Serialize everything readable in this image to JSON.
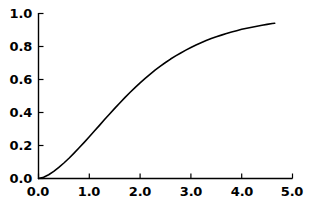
{
  "chart_data": {
    "type": "line",
    "title": "",
    "subtitle": "",
    "xlabel": "",
    "ylabel": "",
    "xlim": [
      0.0,
      5.0
    ],
    "ylim": [
      0.0,
      1.0
    ],
    "grid": false,
    "legend": null,
    "legend_position": "none",
    "xticks": [
      "0.0",
      "1.0",
      "2.0",
      "3.0",
      "4.0",
      "5.0"
    ],
    "xtick_values": [
      0.0,
      1.0,
      2.0,
      3.0,
      4.0,
      5.0
    ],
    "yticks": [
      "0.0",
      "0.2",
      "0.4",
      "0.6",
      "0.8",
      "1.0"
    ],
    "ytick_values": [
      0.0,
      0.2,
      0.4,
      0.6,
      0.8,
      1.0
    ],
    "tick_direction": "in",
    "series": [
      {
        "name": "curve",
        "color": "#000000",
        "linewidth": 1.6,
        "x": [
          0.0,
          0.1,
          0.2,
          0.3,
          0.4,
          0.5,
          0.6,
          0.7,
          0.8,
          0.9,
          1.0,
          1.1,
          1.2,
          1.3,
          1.4,
          1.5,
          1.6,
          1.7,
          1.8,
          1.9,
          2.0,
          2.1,
          2.2,
          2.3,
          2.4,
          2.5,
          2.6,
          2.7,
          2.8,
          2.9,
          3.0,
          3.1,
          3.2,
          3.3,
          3.4,
          3.5,
          3.6,
          3.7,
          3.8,
          3.9,
          4.0,
          4.1,
          4.2,
          4.3,
          4.4,
          4.5,
          4.6,
          4.65
        ],
        "y": [
          0.0,
          0.008,
          0.023,
          0.043,
          0.067,
          0.094,
          0.123,
          0.154,
          0.186,
          0.219,
          0.253,
          0.288,
          0.322,
          0.357,
          0.391,
          0.425,
          0.458,
          0.49,
          0.521,
          0.551,
          0.58,
          0.607,
          0.633,
          0.658,
          0.681,
          0.703,
          0.724,
          0.743,
          0.761,
          0.778,
          0.794,
          0.809,
          0.823,
          0.836,
          0.848,
          0.859,
          0.869,
          0.879,
          0.888,
          0.896,
          0.904,
          0.911,
          0.917,
          0.923,
          0.929,
          0.934,
          0.939,
          0.941
        ]
      }
    ],
    "axes": {
      "spines": [
        "left",
        "bottom"
      ],
      "spine_color": "#000000",
      "spine_width": 1.4
    }
  },
  "axis": {
    "y_labels": [
      "1.0",
      "0.8",
      "0.6",
      "0.4",
      "0.2",
      "0.0"
    ],
    "x_labels": [
      "0.0",
      "1.0",
      "2.0",
      "3.0",
      "4.0",
      "5.0"
    ]
  }
}
